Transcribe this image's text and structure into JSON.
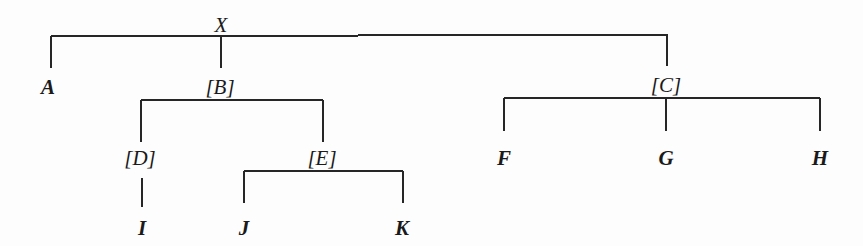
{
  "diagram": {
    "type": "tree",
    "root": "X",
    "nodes": [
      {
        "id": "X",
        "label": "X",
        "style": "italic",
        "x": 221,
        "y": 32
      },
      {
        "id": "A",
        "label": "A",
        "style": "bold-italic",
        "x": 48,
        "y": 94
      },
      {
        "id": "B",
        "label": "[B]",
        "style": "italic",
        "x": 220,
        "y": 94
      },
      {
        "id": "C",
        "label": "[C]",
        "style": "italic",
        "x": 666,
        "y": 92
      },
      {
        "id": "D",
        "label": "[D]",
        "style": "italic",
        "x": 140,
        "y": 165
      },
      {
        "id": "E",
        "label": "[E]",
        "style": "italic",
        "x": 322,
        "y": 165
      },
      {
        "id": "F",
        "label": "F",
        "style": "bold-italic",
        "x": 504,
        "y": 165
      },
      {
        "id": "G",
        "label": "G",
        "style": "bold-italic",
        "x": 666,
        "y": 165
      },
      {
        "id": "H",
        "label": "H",
        "style": "bold-italic",
        "x": 820,
        "y": 165
      },
      {
        "id": "I",
        "label": "I",
        "style": "bold-italic",
        "x": 142,
        "y": 235
      },
      {
        "id": "J",
        "label": "J",
        "style": "bold-italic",
        "x": 244,
        "y": 235
      },
      {
        "id": "K",
        "label": "K",
        "style": "bold-italic",
        "x": 402,
        "y": 235
      }
    ],
    "edges": [
      [
        "X",
        "A"
      ],
      [
        "X",
        "B"
      ],
      [
        "X",
        "C"
      ],
      [
        "B",
        "D"
      ],
      [
        "B",
        "E"
      ],
      [
        "D",
        "I"
      ],
      [
        "E",
        "J"
      ],
      [
        "E",
        "K"
      ],
      [
        "C",
        "F"
      ],
      [
        "C",
        "G"
      ],
      [
        "C",
        "H"
      ]
    ],
    "lines": [
      {
        "x1": 51,
        "y1": 36,
        "x2": 668,
        "y2": 35
      },
      {
        "x1": 51,
        "y1": 36,
        "x2": 51,
        "y2": 68
      },
      {
        "x1": 221,
        "y1": 36,
        "x2": 221,
        "y2": 68
      },
      {
        "x1": 667,
        "y1": 35,
        "x2": 667,
        "y2": 66
      },
      {
        "x1": 141,
        "y1": 100,
        "x2": 323,
        "y2": 100
      },
      {
        "x1": 141,
        "y1": 100,
        "x2": 141,
        "y2": 142
      },
      {
        "x1": 323,
        "y1": 100,
        "x2": 323,
        "y2": 142
      },
      {
        "x1": 142,
        "y1": 178,
        "x2": 142,
        "y2": 207
      },
      {
        "x1": 244,
        "y1": 171,
        "x2": 403,
        "y2": 171
      },
      {
        "x1": 244,
        "y1": 171,
        "x2": 244,
        "y2": 203
      },
      {
        "x1": 403,
        "y1": 171,
        "x2": 403,
        "y2": 203
      },
      {
        "x1": 504,
        "y1": 98,
        "x2": 820,
        "y2": 98
      },
      {
        "x1": 504,
        "y1": 98,
        "x2": 504,
        "y2": 131
      },
      {
        "x1": 666,
        "y1": 98,
        "x2": 666,
        "y2": 131
      },
      {
        "x1": 820,
        "y1": 98,
        "x2": 820,
        "y2": 131
      }
    ]
  }
}
